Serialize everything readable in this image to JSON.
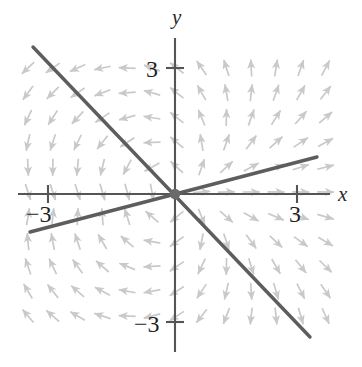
{
  "figure": {
    "type": "direction-field",
    "background": "#ffffff",
    "axis_color": "#555555",
    "solution_line_color": "#5d5d5d",
    "arrow_color": "#c9c9c9",
    "origin_px": [
      175,
      194
    ],
    "unit_px": 40.5
  },
  "axes": {
    "x_label": "x",
    "y_label": "y",
    "x_label_pos": [
      338,
      201
    ],
    "y_label_pos": [
      172,
      24
    ],
    "x_axis": {
      "x1": 18,
      "y1": 194,
      "x2": 330,
      "y2": 194
    },
    "y_axis": {
      "x1": 175,
      "y1": 38,
      "x2": 175,
      "y2": 352
    },
    "ticks": [
      {
        "axis": "x",
        "value": "3",
        "px": 297,
        "label_pos": [
          289,
          222
        ]
      },
      {
        "axis": "x",
        "value": "−3",
        "px": 48,
        "label_pos": [
          26,
          222
        ]
      },
      {
        "axis": "y",
        "value": "3",
        "px": 68,
        "label_pos": [
          146,
          77
        ]
      },
      {
        "axis": "y",
        "value": "−3",
        "px": 322,
        "label_pos": [
          134,
          332
        ]
      }
    ]
  },
  "chart_data": {
    "type": "line",
    "title": "",
    "xlabel": "x",
    "ylabel": "y",
    "xlim": [
      -3.9,
      3.8
    ],
    "ylim": [
      -3.9,
      3.7
    ],
    "xticks": [
      -3,
      3
    ],
    "yticks": [
      -3,
      3
    ],
    "grid": false,
    "legend": "none",
    "series": [
      {
        "name": "descending-solution-line",
        "slope": -1.1,
        "intercept": 0,
        "color": "#5d5d5d",
        "points_px": [
          [
            33,
            47
          ],
          [
            310,
            337
          ]
        ]
      },
      {
        "name": "ascending-solution-line",
        "slope": 0.265,
        "intercept": 0,
        "color": "#5d5d5d",
        "points_px": [
          [
            30,
            232
          ],
          [
            317,
            157
          ]
        ]
      }
    ],
    "vector_field": {
      "description": "grid of gray direction arrows; direction rotates about the origin",
      "arrow_color": "#c9c9c9",
      "grid_spacing_px": 24.8,
      "grid_x_px": [
        28,
        52.8,
        77.6,
        102.4,
        127.2,
        152,
        176.8,
        201.6,
        226.4,
        251.2,
        276,
        300.8,
        325.6
      ],
      "grid_y_px": [
        68,
        92.8,
        117.6,
        142.4,
        167.2,
        192,
        216.8,
        241.6,
        266.4,
        291.2,
        316
      ],
      "arrow_length_px": 17
    }
  }
}
